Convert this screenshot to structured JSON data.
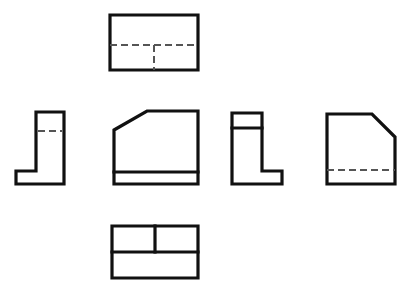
{
  "sheet": {
    "title": "Orthographic Multiview Drawing",
    "width": 414,
    "height": 297,
    "background_color": "#ffffff",
    "visible_line_color": "#111111",
    "hidden_line_color": "#555555",
    "visible_line_width": 3.2,
    "hidden_line_width": 2.0,
    "hidden_line_dash": "7 4"
  },
  "views": [
    {
      "id": "top-view",
      "name": "top-view",
      "label": "",
      "role": "top",
      "bounds": {
        "x": 110,
        "y": 15,
        "width": 88,
        "height": 55
      },
      "outline_points": "110,15 198,15 198,70 110,70",
      "visible_edges": [],
      "hidden_edges": [
        {
          "name": "hidden-horizontal-centerline",
          "points": "110,45 198,45"
        },
        {
          "name": "hidden-vertical-edge",
          "points": "154,45 154,70"
        }
      ]
    },
    {
      "id": "left-side-view",
      "name": "left-side-view",
      "label": "",
      "role": "left-profile",
      "bounds": {
        "x": 16,
        "y": 112,
        "width": 48,
        "height": 72
      },
      "outline_points": "36,112 64,112 64,184 16,184 16,171 36,171",
      "visible_edges": [],
      "hidden_edges": [
        {
          "name": "hidden-horizontal-edge",
          "points": "38,131 62,131"
        }
      ]
    },
    {
      "id": "front-view",
      "name": "front-view",
      "label": "",
      "role": "front",
      "bounds": {
        "x": 114,
        "y": 111,
        "width": 84,
        "height": 73
      },
      "outline_points": "114,130 147,111 198,111 198,184 114,184",
      "visible_edges": [
        {
          "name": "front-base-line",
          "points": "114,172 198,172"
        }
      ],
      "hidden_edges": []
    },
    {
      "id": "auxiliary-side-view",
      "name": "auxiliary-side-view",
      "label": "",
      "role": "right-profile",
      "bounds": {
        "x": 232,
        "y": 113,
        "width": 50,
        "height": 71
      },
      "outline_points": "232,113 262,113 262,171 282,171 282,184 232,184",
      "visible_edges": [
        {
          "name": "auxiliary-top-step-line",
          "points": "232,128 262,128"
        }
      ],
      "hidden_edges": []
    },
    {
      "id": "right-view",
      "name": "right-view",
      "label": "",
      "role": "right",
      "bounds": {
        "x": 327,
        "y": 114,
        "width": 68,
        "height": 70
      },
      "outline_points": "327,114 372,114 395,137 395,184 327,184",
      "visible_edges": [],
      "hidden_edges": [
        {
          "name": "hidden-base-line",
          "points": "327,170 395,170"
        }
      ]
    },
    {
      "id": "bottom-view",
      "name": "bottom-view",
      "label": "",
      "role": "bottom",
      "bounds": {
        "x": 112,
        "y": 226,
        "width": 86,
        "height": 52
      },
      "outline_points": "112,226 198,226 198,278 112,278",
      "visible_edges": [
        {
          "name": "bottom-horizontal-divider",
          "points": "112,252 198,252"
        },
        {
          "name": "bottom-vertical-divider",
          "points": "155,226 155,252"
        }
      ],
      "hidden_edges": []
    }
  ]
}
